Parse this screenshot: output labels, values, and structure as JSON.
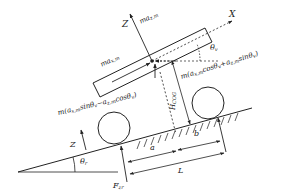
{
  "diagram": {
    "type": "free-body force diagram of vehicle on slope",
    "axes": {
      "x_label": "X",
      "z_label": "Z",
      "ground_z_label": "Z"
    },
    "angles": {
      "theta_v": {
        "sym": "θ",
        "sub": "v"
      },
      "theta_r": {
        "sym": "θ",
        "sub": "r"
      }
    },
    "forces": {
      "ma_z": {
        "pre": "ma",
        "sub": "z,m"
      },
      "ma_x": {
        "pre": "ma",
        "sub": "x,m"
      },
      "front_expr": {
        "a": "m(a",
        "asub": "x,m",
        "b": "cosθ",
        "bsub": "v",
        "c": "+a",
        "csub": "z,m",
        "d": "sinθ",
        "dsub": "v",
        "e": ")"
      },
      "rear_expr": {
        "a": "m(a",
        "asub": "x,m",
        "b": "sinθ",
        "bsub": "v",
        "c": "−a",
        "csub": "z,m",
        "d": "cosθ",
        "dsub": "v",
        "e": ")"
      },
      "f_zr": {
        "pre": "F",
        "sub": "zr"
      }
    },
    "dimensions": {
      "h_cog": {
        "pre": "H",
        "sub": "COG"
      },
      "a": "a",
      "b": "b",
      "L": "L"
    },
    "colors": {
      "stroke": "#222222",
      "background": "#ffffff"
    }
  }
}
